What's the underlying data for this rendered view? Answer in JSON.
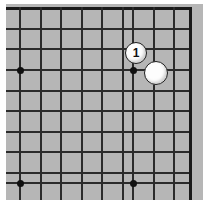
{
  "figure": {
    "name": "go-board-corner-diagram",
    "board_size": 19,
    "region": "top-right corner",
    "background_color": "#ffffff",
    "board_color": "#b6b6b6",
    "line_color": "#2b2b2b",
    "edge_line_color": "#1a1a1a",
    "stone_white_color": "#fdfdfd",
    "stone_outline_color": "#1d1d1d",
    "hoshi_color": "#101010"
  },
  "grid": {
    "columns_px": [
      20,
      40.5,
      61,
      81.5,
      102,
      122.5,
      133,
      153.5,
      174,
      190
    ],
    "rows_px": [
      8,
      28.5,
      49,
      70,
      90.5,
      111,
      131.5,
      152,
      172.5,
      183
    ],
    "vertical_lines_x": [
      20,
      40.5,
      61,
      81.5,
      102,
      112.5,
      133,
      153.5,
      174,
      190
    ],
    "horizontal_lines_y": [
      8,
      28.5,
      49,
      70,
      90.5,
      111,
      131.5,
      152,
      172.5,
      183
    ],
    "edges": {
      "top_y": 8,
      "right_x": 190
    }
  },
  "star_points": [
    {
      "name": "hoshi-left",
      "x": 20,
      "y": 70
    },
    {
      "name": "hoshi-corner",
      "x": 133,
      "y": 70
    },
    {
      "name": "hoshi-bottom-left",
      "x": 20,
      "y": 183
    },
    {
      "name": "hoshi-bottom-center",
      "x": 133,
      "y": 183
    }
  ],
  "stones": [
    {
      "name": "stone-move-1",
      "color": "white",
      "label": "1",
      "x": 136,
      "y": 53,
      "diameter": 22,
      "font_size": 12
    },
    {
      "name": "stone-white-plain",
      "color": "white",
      "label": "",
      "x": 156,
      "y": 73,
      "diameter": 24,
      "font_size": 12
    }
  ]
}
